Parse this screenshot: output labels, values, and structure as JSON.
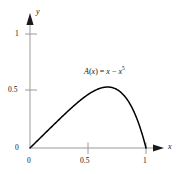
{
  "chart_data": {
    "type": "line",
    "title": "",
    "subtitle": "",
    "xlabel": "x",
    "ylabel": "y",
    "xlim": [
      0,
      1.06
    ],
    "ylim": [
      0,
      1.12
    ],
    "grid": false,
    "legend": null,
    "xticks": [
      "0",
      "0.5",
      "1"
    ],
    "xtick_values": [
      0,
      0.5,
      1
    ],
    "yticks": [
      "0",
      "0.5",
      "1"
    ],
    "ytick_values": [
      0,
      0.5,
      1
    ],
    "annotations": [
      {
        "name": "curve-equation",
        "prefix": "A",
        "open_paren": "(",
        "arg": "x",
        "close_paren": ")",
        "equals": " = ",
        "term1": "x",
        "minus": " − ",
        "term2_base": "x",
        "term2_exponent": "5",
        "plain": "A(x) = x − x^5"
      }
    ],
    "series": [
      {
        "name": "A(x) = x - x^5",
        "formula": "x - Math.pow(x,5)",
        "color": "#000000",
        "peak_x": 0.669,
        "peak_y": 0.535,
        "x": [
          0,
          0.05,
          0.1,
          0.15,
          0.2,
          0.25,
          0.3,
          0.35,
          0.4,
          0.45,
          0.5,
          0.55,
          0.6,
          0.65,
          0.669,
          0.7,
          0.75,
          0.8,
          0.85,
          0.9,
          0.95,
          1
        ],
        "values": [
          0,
          0.05,
          0.1,
          0.15,
          0.1997,
          0.249,
          0.2976,
          0.3448,
          0.3898,
          0.4316,
          0.4688,
          0.5,
          0.5222,
          0.534,
          0.5351,
          0.5319,
          0.5127,
          0.4723,
          0.4063,
          0.3095,
          0.1759,
          0
        ]
      }
    ]
  },
  "axes": {
    "x_axis_name": "x",
    "y_axis_name": "y",
    "x_tick_0": "0",
    "x_tick_half": "0.5",
    "x_tick_one": "1",
    "y_tick_0": "0",
    "y_tick_half": "0.5",
    "y_tick_one": "1",
    "axis_color": "#9a9a9a",
    "curve_color": "#000000",
    "text_color": "#111111",
    "background": "#ffffff"
  }
}
